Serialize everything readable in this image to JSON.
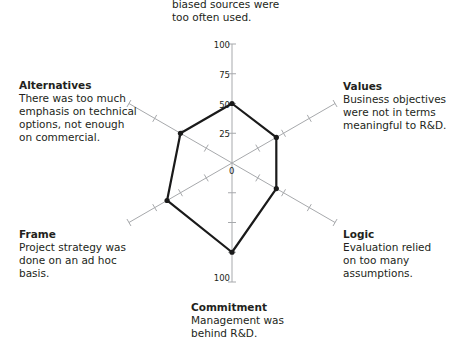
{
  "chart_data": {
    "type": "radar",
    "title": "",
    "axes": [
      "Source",
      "Values",
      "Logic",
      "Commitment",
      "Frame",
      "Alternatives"
    ],
    "values": [
      50,
      43,
      43,
      75,
      63,
      50
    ],
    "range": [
      0,
      100
    ],
    "tick_labels": [
      "0",
      "25",
      "50",
      "75",
      "100"
    ],
    "bottom_tick_label": "100"
  },
  "labels": {
    "top": {
      "title": "",
      "desc": "biased sources were\ntoo often used."
    },
    "values": {
      "title": "Values",
      "desc": "Business objectives\nwere not in terms\nmeaningful to R&D."
    },
    "logic": {
      "title": "Logic",
      "desc": "Evaluation relied\non too many\nassumptions."
    },
    "commitment": {
      "title": "Commitment",
      "desc": "Management was\nbehind R&D."
    },
    "frame": {
      "title": "Frame",
      "desc": "Project strategy was\ndone on an ad hoc\nbasis."
    },
    "alternatives": {
      "title": "Alternatives",
      "desc": "There was too much\nemphasis on technical\noptions, not enough\non commercial."
    }
  },
  "colors": {
    "axis": "#a7a9ac",
    "polygon": "#1a1a1a",
    "text": "#231f20"
  }
}
